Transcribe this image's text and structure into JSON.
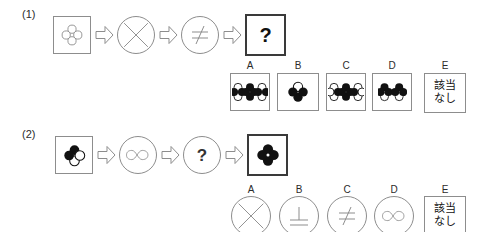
{
  "page": {
    "width": 482,
    "height": 232,
    "background": "#ffffff",
    "line_color": "#8d8d8d",
    "strong_line_color": "#3a3a3a",
    "text_color": "#1a1a1a"
  },
  "problems": [
    {
      "number": "(1)",
      "sequence": [
        {
          "kind": "box",
          "content": "clover-4-outline",
          "name": "input-figure"
        },
        {
          "kind": "arrow",
          "content": "arrow-right",
          "name": "arrow-1"
        },
        {
          "kind": "circle",
          "content": "circled-cross",
          "name": "operator-1"
        },
        {
          "kind": "arrow",
          "content": "arrow-right",
          "name": "arrow-2"
        },
        {
          "kind": "circle",
          "content": "not-equal",
          "name": "operator-2"
        },
        {
          "kind": "arrow",
          "content": "arrow-right",
          "name": "arrow-3"
        },
        {
          "kind": "box-strong",
          "content": "?",
          "name": "answer-slot"
        }
      ],
      "options": [
        {
          "label": "A",
          "kind": "figure",
          "content": "three-clovers-wbw",
          "name": "option-a"
        },
        {
          "label": "B",
          "kind": "figure",
          "content": "one-clover-black",
          "name": "option-b"
        },
        {
          "label": "C",
          "kind": "figure",
          "content": "three-clovers-open-ends",
          "name": "option-c"
        },
        {
          "label": "D",
          "kind": "figure",
          "content": "two-clovers-black",
          "name": "option-d"
        },
        {
          "label": "E",
          "kind": "text",
          "content": [
            "該当",
            "なし"
          ],
          "name": "option-e"
        }
      ]
    },
    {
      "number": "(2)",
      "sequence": [
        {
          "kind": "box",
          "content": "clover-4-half-black",
          "name": "input-figure"
        },
        {
          "kind": "arrow",
          "content": "arrow-right",
          "name": "arrow-1"
        },
        {
          "kind": "circle",
          "content": "infinity",
          "name": "operator-1"
        },
        {
          "kind": "arrow",
          "content": "arrow-right",
          "name": "arrow-2"
        },
        {
          "kind": "circle",
          "content": "?",
          "name": "operator-unknown"
        },
        {
          "kind": "arrow",
          "content": "arrow-right",
          "name": "arrow-3"
        },
        {
          "kind": "box-strong",
          "content": "clover-4-black",
          "name": "output-figure"
        }
      ],
      "options": [
        {
          "label": "A",
          "kind": "circle",
          "content": "circled-cross",
          "name": "option-a"
        },
        {
          "label": "B",
          "kind": "circle",
          "content": "perpendicular",
          "name": "option-b"
        },
        {
          "label": "C",
          "kind": "circle",
          "content": "not-equal",
          "name": "option-c"
        },
        {
          "label": "D",
          "kind": "circle",
          "content": "infinity",
          "name": "option-d"
        },
        {
          "label": "E",
          "kind": "text",
          "content": [
            "該当",
            "なし"
          ],
          "name": "option-e"
        }
      ]
    }
  ]
}
